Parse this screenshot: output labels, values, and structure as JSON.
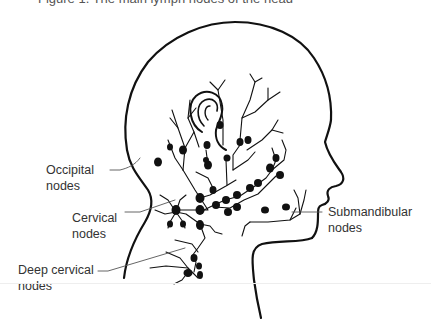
{
  "figure": {
    "caption": "Figure 1. The main lymph nodes of the head",
    "stroke_color": "#111111",
    "label_color": "#333333"
  },
  "labels": {
    "occipital": [
      "Occipital",
      "nodes"
    ],
    "cervical": [
      "Cervical",
      "nodes"
    ],
    "deep_cervical": [
      "Deep cervical",
      "nodes"
    ],
    "submandibular": [
      "Submandibular",
      "nodes"
    ]
  }
}
